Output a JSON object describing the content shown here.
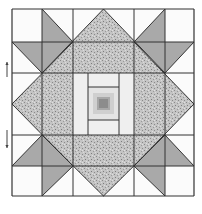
{
  "diagram": {
    "type": "quilt-block",
    "colors": {
      "background": "#ffffff",
      "white_patch": "#fbfbfb",
      "gray_patch": "#a9a9a9",
      "speckle_base": "#c4c4c4",
      "speckle_dark": "#8a8a8a",
      "center_light": "#efefef",
      "center_mid": "#cfcfcf",
      "center_dark": "#8c8c8c",
      "seam": "#333333"
    },
    "arrows": [
      {
        "name": "press-direction-up",
        "direction": "up"
      },
      {
        "name": "press-direction-down",
        "direction": "down"
      }
    ],
    "caption": ""
  }
}
